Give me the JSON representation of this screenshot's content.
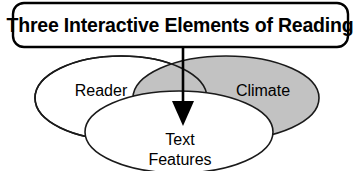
{
  "diagram": {
    "type": "venn-diagram",
    "title_box": {
      "label": "Three Interactive Elements of Reading"
    },
    "circles": [
      {
        "id": "reader",
        "label": "Reader",
        "fill": "#ffffff"
      },
      {
        "id": "climate",
        "label": "Climate",
        "fill": "#c2c2c2"
      },
      {
        "id": "text-features",
        "label_line1": "Text",
        "label_line2": "Features",
        "fill": "#ffffff"
      }
    ],
    "connector": {
      "name": "down-arrow",
      "description": "arrow from title box into central overlap"
    },
    "colors": {
      "background": "#ffffff",
      "stroke": "#1a1a1a",
      "shaded_fill": "#c2c2c2",
      "text": "#000000"
    }
  }
}
